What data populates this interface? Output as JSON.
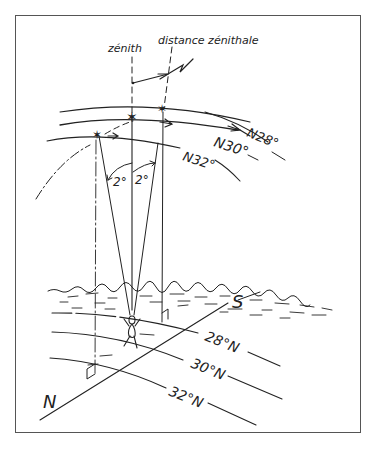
{
  "diagram": {
    "labels": {
      "zenith": "zénith",
      "zenith_distance": "distance zénithale",
      "sky_n28": "N28°",
      "sky_n30": "N30°",
      "sky_n32": "N32°",
      "angle_left": "2°",
      "angle_right": "2°",
      "ground_28": "28°N",
      "ground_30": "30°N",
      "ground_32": "32°N",
      "south": "S",
      "north": "N"
    },
    "star_paths": [
      {
        "declination": "N28°"
      },
      {
        "declination": "N30°"
      },
      {
        "declination": "N32°"
      }
    ],
    "ground_parallels": [
      {
        "latitude": "28°N"
      },
      {
        "latitude": "30°N"
      },
      {
        "latitude": "32°N"
      }
    ],
    "colors": {
      "ink": "#222222",
      "frame": "#555555",
      "background": "#ffffff"
    }
  }
}
